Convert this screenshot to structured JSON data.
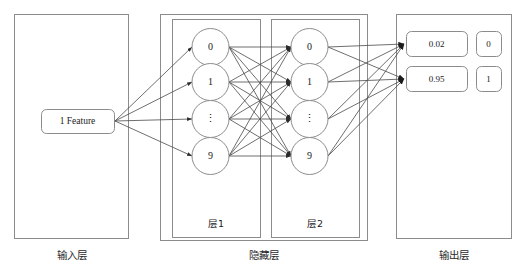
{
  "figure": {
    "title_strip": "",
    "bottom_caption": "",
    "stroke_color": "#8c8c8c",
    "edge_color": "#4a4a4a",
    "text_color": "#1a1a1a",
    "background": "#ffffff"
  },
  "input_layer": {
    "caption": "输入层",
    "feature_box_label": "1 Feature"
  },
  "hidden_layer": {
    "caption": "隐藏层",
    "layers": [
      {
        "sub_label": "层1",
        "nodes": [
          {
            "label": "0"
          },
          {
            "label": "1"
          },
          {
            "label": "⋮"
          },
          {
            "label": "9"
          }
        ]
      },
      {
        "sub_label": "层2",
        "nodes": [
          {
            "label": "0"
          },
          {
            "label": "1"
          },
          {
            "label": "⋮"
          },
          {
            "label": "9"
          }
        ]
      }
    ]
  },
  "output_layer": {
    "caption": "输出层",
    "rows": [
      {
        "value": "0.02",
        "class_label": "0"
      },
      {
        "value": "0.95",
        "class_label": "1"
      }
    ]
  }
}
